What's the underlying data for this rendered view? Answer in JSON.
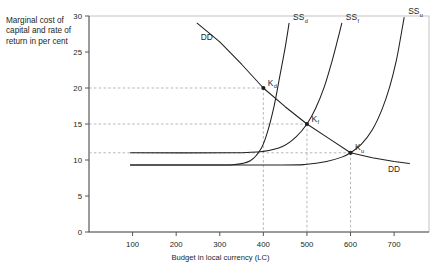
{
  "chart_data": {
    "type": "line",
    "title": "",
    "xlabel": "Budget in local currency (LC)",
    "ylabel": "Marginal cost of capital and rate of return in per cent",
    "xlim": [
      0,
      780
    ],
    "ylim": [
      0,
      30
    ],
    "xticks": [
      100,
      200,
      300,
      400,
      500,
      600,
      700
    ],
    "yticks": [
      0,
      5,
      10,
      15,
      20,
      25,
      30
    ],
    "grid": false,
    "legend": "inline-labels",
    "series": [
      {
        "name": "DD",
        "kind": "demand",
        "label": "DD",
        "points": [
          [
            248,
            29.0
          ],
          [
            300,
            26.4
          ],
          [
            350,
            23.3
          ],
          [
            400,
            20.0
          ],
          [
            450,
            17.4
          ],
          [
            500,
            15.0
          ],
          [
            550,
            13.0
          ],
          [
            600,
            11.0
          ],
          [
            650,
            10.3
          ],
          [
            700,
            9.8
          ],
          [
            735,
            9.5
          ]
        ]
      },
      {
        "name": "SSd",
        "kind": "supply",
        "label": "SS",
        "sublabel": "d",
        "points": [
          [
            95,
            9.3
          ],
          [
            250,
            9.3
          ],
          [
            330,
            9.35
          ],
          [
            370,
            9.9
          ],
          [
            395,
            11.6
          ],
          [
            410,
            14.0
          ],
          [
            425,
            17.6
          ],
          [
            437,
            21.4
          ],
          [
            450,
            25.6
          ],
          [
            459,
            29.0
          ]
        ]
      },
      {
        "name": "SSf",
        "kind": "supply",
        "label": "SS",
        "sublabel": "f",
        "points": [
          [
            95,
            11.0
          ],
          [
            330,
            11.0
          ],
          [
            400,
            11.2
          ],
          [
            445,
            11.9
          ],
          [
            475,
            13.2
          ],
          [
            500,
            15.0
          ],
          [
            520,
            17.2
          ],
          [
            540,
            20.2
          ],
          [
            556,
            23.4
          ],
          [
            570,
            26.6
          ],
          [
            580,
            29.0
          ]
        ]
      },
      {
        "name": "SSu",
        "kind": "supply",
        "label": "SS",
        "sublabel": "u",
        "points": [
          [
            95,
            9.3
          ],
          [
            430,
            9.3
          ],
          [
            500,
            9.4
          ],
          [
            545,
            9.8
          ],
          [
            580,
            10.4
          ],
          [
            600,
            11.0
          ],
          [
            625,
            12.2
          ],
          [
            650,
            14.2
          ],
          [
            672,
            17.0
          ],
          [
            690,
            20.2
          ],
          [
            705,
            23.8
          ],
          [
            716,
            27.4
          ],
          [
            723,
            29.8
          ]
        ]
      }
    ],
    "equilibria": [
      {
        "name": "Kd",
        "label": "K",
        "sublabel": "d",
        "x": 400,
        "y": 20,
        "guides": [
          "h",
          "v"
        ]
      },
      {
        "name": "Kf",
        "label": "K",
        "sublabel": "f",
        "x": 500,
        "y": 15,
        "guides": [
          "h",
          "v"
        ]
      },
      {
        "name": "Ku",
        "label": "K",
        "sublabel": "u",
        "x": 600,
        "y": 11,
        "guides": [
          "h",
          "v"
        ]
      }
    ],
    "annotations": [
      {
        "name": "dd-label-top",
        "text": "DD",
        "x": 270,
        "y": 26.6
      },
      {
        "name": "dd-label-right",
        "text": "DD",
        "x": 700,
        "y": 8.3
      }
    ],
    "colors": {
      "curve": "#231f20",
      "guide": "#9a9a9a",
      "frame": "#b5b5b5",
      "axis": "#555555",
      "text": "#231f20",
      "background": "#ffffff"
    }
  }
}
